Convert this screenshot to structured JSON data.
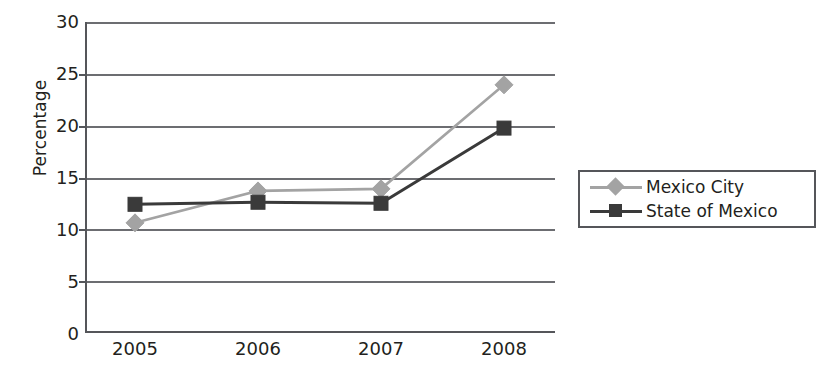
{
  "chart_data": {
    "type": "line",
    "title": "",
    "subtitle": "",
    "xlabel": "",
    "ylabel": "Percentage",
    "categories": [
      "2005",
      "2006",
      "2007",
      "2008"
    ],
    "x": [
      2005,
      2006,
      2007,
      2008
    ],
    "series": [
      {
        "name": "Mexico City",
        "values": [
          10.5,
          13.6,
          13.8,
          23.9
        ],
        "color": "#a3a3a3",
        "marker": "diamond"
      },
      {
        "name": "State of Mexico",
        "values": [
          12.3,
          12.5,
          12.4,
          19.7
        ],
        "color": "#3a3a3a",
        "marker": "square"
      }
    ],
    "ylim": [
      0,
      30
    ],
    "ytick_step": 5,
    "yticks": [
      "30",
      "25",
      "20",
      "15",
      "10",
      "5",
      "0"
    ],
    "grid": "horizontal",
    "legend_position": "right-middle",
    "legend_border": true,
    "annotations": []
  },
  "axes": {
    "y_axis_title": "Percentage",
    "y_tick_labels": [
      "30",
      "25",
      "20",
      "15",
      "10",
      "5",
      "0"
    ],
    "x_tick_labels": [
      "2005",
      "2006",
      "2007",
      "2008"
    ]
  },
  "legend": {
    "entries": [
      {
        "label": "Mexico City",
        "marker": "diamond-marker",
        "color": "#a3a3a3"
      },
      {
        "label": "State of Mexico",
        "marker": "square-marker",
        "color": "#3a3a3a"
      }
    ]
  },
  "colors": {
    "axis": "#55565a",
    "gridline": "#6c6d71",
    "series_mexico_city": "#a3a3a3",
    "series_state_of_mexico": "#3a3a3a",
    "background": "#ffffff",
    "text": "#231f20"
  }
}
